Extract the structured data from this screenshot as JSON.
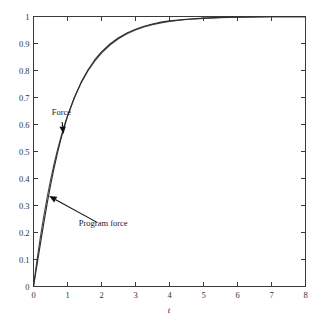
{
  "chart_data": {
    "type": "line",
    "title": "",
    "xlabel": "t",
    "ylabel": "",
    "xlim": [
      0,
      8
    ],
    "ylim": [
      0,
      1
    ],
    "grid": false,
    "legend_position": "none",
    "x_ticks": [
      "0",
      "1",
      "2",
      "3",
      "4",
      "5",
      "6",
      "7",
      "8"
    ],
    "x_tick_values": [
      0,
      1,
      2,
      3,
      4,
      5,
      6,
      7,
      8
    ],
    "y_ticks": [
      "0",
      "0.1",
      "0.2",
      "0.3",
      "0.4",
      "0.5",
      "0.6",
      "0.7",
      "0.8",
      "0.9",
      "1"
    ],
    "y_tick_values": [
      0,
      0.1,
      0.2,
      0.3,
      0.4,
      0.5,
      0.6,
      0.7,
      0.8,
      0.9,
      1
    ],
    "x": [
      0,
      0.1,
      0.2,
      0.3,
      0.4,
      0.5,
      0.6,
      0.7,
      0.8,
      0.9,
      1,
      1.2,
      1.4,
      1.6,
      1.8,
      2,
      2.25,
      2.5,
      2.75,
      3,
      3.25,
      3.5,
      3.75,
      4,
      4.5,
      5,
      5.5,
      6,
      6.5,
      7,
      7.5,
      8
    ],
    "series": [
      {
        "name": "Force",
        "color": "#4a4a4a",
        "values": [
          0,
          0.0952,
          0.1813,
          0.2592,
          0.3297,
          0.3935,
          0.4512,
          0.5034,
          0.5507,
          0.5934,
          0.6321,
          0.6988,
          0.7534,
          0.7981,
          0.8347,
          0.8647,
          0.8946,
          0.9179,
          0.9361,
          0.9502,
          0.9612,
          0.9698,
          0.9765,
          0.9817,
          0.9889,
          0.9933,
          0.9959,
          0.9975,
          0.9985,
          0.9991,
          0.9994,
          0.9997
        ]
      },
      {
        "name": "Program force",
        "color": "#2e2e2e",
        "values": [
          0,
          0.077,
          0.156,
          0.233,
          0.306,
          0.374,
          0.436,
          0.492,
          0.543,
          0.589,
          0.63,
          0.699,
          0.756,
          0.802,
          0.839,
          0.869,
          0.898,
          0.921,
          0.939,
          0.953,
          0.964,
          0.972,
          0.979,
          0.984,
          0.99,
          0.994,
          0.9965,
          0.9978,
          0.9987,
          0.9992,
          0.9995,
          0.9997
        ]
      }
    ],
    "annotations": [
      {
        "text": "Force",
        "label_x": 0.82,
        "label_y": 0.635,
        "point_x": 0.88,
        "point_y": 0.565
      },
      {
        "text": "Program force",
        "label_x": 2.05,
        "label_y": 0.225,
        "point_x": 0.46,
        "point_y": 0.335
      }
    ]
  }
}
